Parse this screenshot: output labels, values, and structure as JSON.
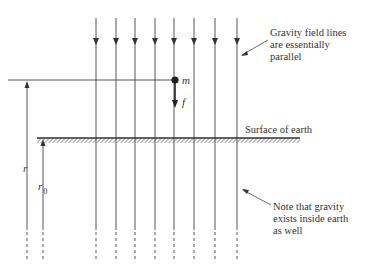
{
  "diagram": {
    "labels": {
      "mass": "m",
      "force": "f",
      "r": "r",
      "r0_base": "r",
      "r0_sub": "0",
      "surface": "Surface of earth"
    },
    "annotations": {
      "top": [
        "Gravity field lines",
        "are essentially",
        "parallel"
      ],
      "bottom": [
        "Note that gravity",
        "exists inside earth",
        "as well"
      ]
    },
    "field_lines": {
      "count": 8,
      "x_positions": [
        96,
        116,
        135,
        155,
        174,
        194,
        215,
        237
      ],
      "direction": "down"
    },
    "colors": {
      "line": "#444444",
      "text": "#333333",
      "background": "#ffffff"
    }
  }
}
